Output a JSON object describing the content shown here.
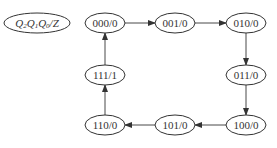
{
  "diagram": {
    "title_label": "Q2Q1Q0/Z",
    "legend": {
      "q2": "Q",
      "s2": "2",
      "q1": "Q",
      "s1": "1",
      "q0": "Q",
      "s0": "0",
      "slash_z": "/Z"
    },
    "states": [
      {
        "id": "s000",
        "label": "000/0"
      },
      {
        "id": "s001",
        "label": "001/0"
      },
      {
        "id": "s010",
        "label": "010/0"
      },
      {
        "id": "s011",
        "label": "011/0"
      },
      {
        "id": "s100",
        "label": "100/0"
      },
      {
        "id": "s101",
        "label": "101/0"
      },
      {
        "id": "s110",
        "label": "110/0"
      },
      {
        "id": "s111",
        "label": "111/1"
      }
    ],
    "transitions": [
      {
        "from": "000/0",
        "to": "001/0"
      },
      {
        "from": "001/0",
        "to": "010/0"
      },
      {
        "from": "010/0",
        "to": "011/0"
      },
      {
        "from": "011/0",
        "to": "100/0"
      },
      {
        "from": "100/0",
        "to": "101/0"
      },
      {
        "from": "101/0",
        "to": "110/0"
      },
      {
        "from": "110/0",
        "to": "111/1"
      },
      {
        "from": "111/1",
        "to": "000/0"
      }
    ]
  }
}
